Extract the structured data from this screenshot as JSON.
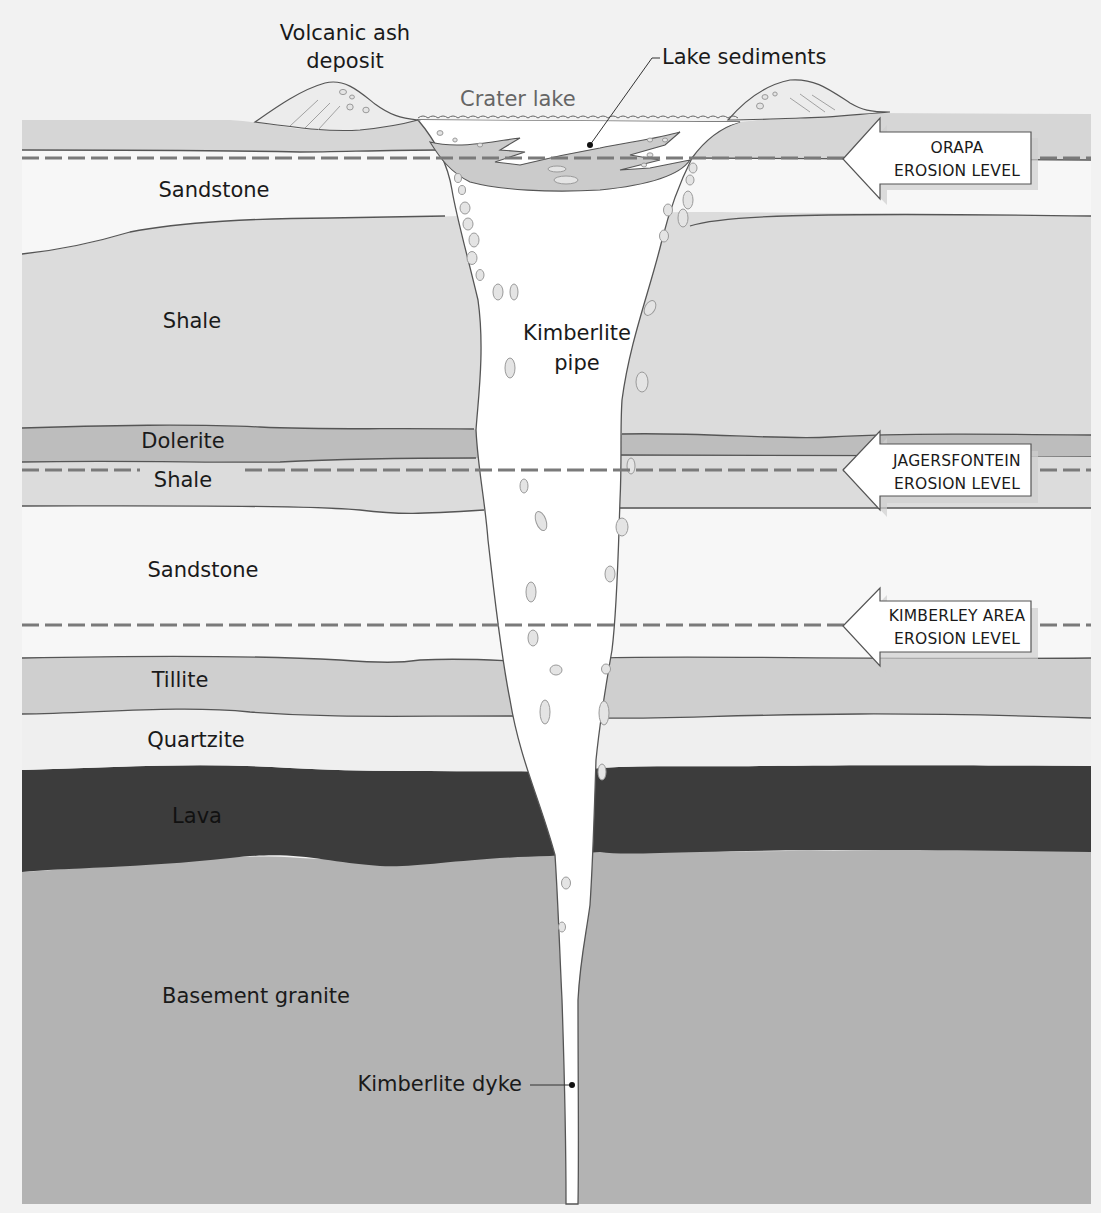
{
  "diagram": {
    "type": "geological cross-section",
    "colors": {
      "background": "#f2f2f2",
      "surface_layer": "#d6d6d6",
      "sandstone": "#f7f7f7",
      "shale": "#dcdcdc",
      "dolerite": "#bdbdbd",
      "tillite": "#cfcfcf",
      "quartzite": "#efefef",
      "lava": "#3c3c3c",
      "basement_granite": "#b3b3b3",
      "pipe": "#ffffff",
      "lake_sediments": "#cbcbcb",
      "dashed_line": "#7a7a7a"
    }
  },
  "labels": {
    "volcanic_ash_line1": "Volcanic ash",
    "volcanic_ash_line2": "deposit",
    "lake_sediments": "Lake sediments",
    "crater_lake": "Crater lake",
    "kimberlite_pipe_line1": "Kimberlite",
    "kimberlite_pipe_line2": "pipe",
    "kimberlite_dyke": "Kimberlite dyke"
  },
  "layers": [
    {
      "name": "Sandstone",
      "order": 1
    },
    {
      "name": "Shale",
      "order": 2
    },
    {
      "name": "Dolerite",
      "order": 3
    },
    {
      "name": "Shale",
      "order": 4
    },
    {
      "name": "Sandstone",
      "order": 5
    },
    {
      "name": "Tillite",
      "order": 6
    },
    {
      "name": "Quartzite",
      "order": 7
    },
    {
      "name": "Lava",
      "order": 8
    },
    {
      "name": "Basement granite",
      "order": 9
    }
  ],
  "erosion_levels": [
    {
      "line1": "ORAPA",
      "line2": "EROSION LEVEL"
    },
    {
      "line1": "JAGERSFONTEIN",
      "line2": "EROSION LEVEL"
    },
    {
      "line1": "KIMBERLEY AREA",
      "line2": "EROSION LEVEL"
    }
  ]
}
